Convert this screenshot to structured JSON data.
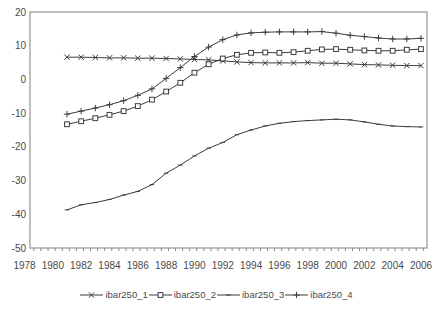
{
  "chart_data": {
    "type": "line",
    "title": "",
    "xlabel": "",
    "ylabel": "",
    "grid": false,
    "legend_position": "bottom",
    "xlim": [
      1978.4,
      2006.4
    ],
    "ylim": [
      -50,
      20
    ],
    "x_tick_labels": [
      1978,
      1980,
      1982,
      1984,
      1986,
      1988,
      1990,
      1992,
      1994,
      1996,
      1998,
      2000,
      2002,
      2004,
      2006
    ],
    "y_tick_labels": [
      20,
      10,
      0,
      -10,
      -20,
      -30,
      -40,
      -50
    ],
    "x": [
      1981,
      1982,
      1983,
      1984,
      1985,
      1986,
      1987,
      1988,
      1989,
      1990,
      1991,
      1992,
      1993,
      1994,
      1995,
      1996,
      1997,
      1998,
      1999,
      2000,
      2001,
      2002,
      2003,
      2004,
      2005,
      2006
    ],
    "series": [
      {
        "name": "ibar250_1",
        "marker": "x",
        "values": [
          6.6,
          6.6,
          6.5,
          6.4,
          6.4,
          6.3,
          6.3,
          6.2,
          6.1,
          5.9,
          5.8,
          5.5,
          5.2,
          5.0,
          4.9,
          4.9,
          4.9,
          5.0,
          4.8,
          4.8,
          4.6,
          4.4,
          4.3,
          4.2,
          4.1,
          4.1
        ]
      },
      {
        "name": "ibar250_2",
        "marker": "square-open",
        "values": [
          -13.3,
          -12.4,
          -11.5,
          -10.5,
          -9.4,
          -7.9,
          -6.0,
          -3.6,
          -1.0,
          2.0,
          4.5,
          6.2,
          7.3,
          7.9,
          8.0,
          7.9,
          8.1,
          8.5,
          8.9,
          9.0,
          8.8,
          8.6,
          8.5,
          8.5,
          8.8,
          9.0
        ]
      },
      {
        "name": "ibar250_3",
        "marker": "dash",
        "values": [
          -38.7,
          -37.2,
          -36.5,
          -35.6,
          -34.3,
          -33.2,
          -31.2,
          -27.8,
          -25.4,
          -22.7,
          -20.4,
          -18.7,
          -16.4,
          -15.0,
          -13.8,
          -13.0,
          -12.5,
          -12.2,
          -12.0,
          -11.8,
          -12.0,
          -12.6,
          -13.3,
          -13.8,
          -14.0,
          -14.1
        ]
      },
      {
        "name": "ibar250_4",
        "marker": "plus",
        "values": [
          -10.3,
          -9.4,
          -8.5,
          -7.5,
          -6.3,
          -4.7,
          -2.8,
          0.3,
          3.5,
          6.8,
          9.6,
          11.8,
          13.2,
          13.8,
          14.0,
          14.1,
          14.1,
          14.1,
          14.2,
          13.7,
          13.1,
          12.7,
          12.3,
          12.0,
          12.0,
          12.2
        ]
      }
    ],
    "line_color": "#3d3d3d",
    "axis_color": "#8a8a8a",
    "text_color": "#4a4a4a",
    "background_color": "#ffffff"
  }
}
